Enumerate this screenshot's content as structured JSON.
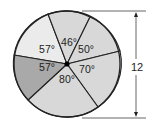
{
  "diagram": {
    "type": "circle-sectors",
    "center": [
      67,
      64
    ],
    "radius": 53,
    "sectors": [
      {
        "label": "57°",
        "angle": 57,
        "fill": "#ebebeb",
        "from": [
          14,
          55
        ],
        "to": [
          48,
          14
        ],
        "label_pos": [
          47,
          53
        ]
      },
      {
        "label": "46°",
        "angle": 46,
        "fill": "#d8d8d8",
        "from": [
          48,
          14
        ],
        "to": [
          90,
          17
        ],
        "label_pos": [
          69,
          46
        ]
      },
      {
        "label": "50°",
        "angle": 50,
        "fill": "#d8d8d8",
        "from": [
          90,
          17
        ],
        "to": [
          120,
          51
        ],
        "label_pos": [
          86,
          53
        ]
      },
      {
        "label": "70°",
        "angle": 70,
        "fill": "#d8d8d8",
        "from": [
          120,
          51
        ],
        "to": [
          98,
          107
        ],
        "label_pos": [
          87,
          73
        ]
      },
      {
        "label": "80°",
        "angle": 80,
        "fill": "#d8d8d8",
        "from": [
          98,
          107
        ],
        "to": [
          28,
          100
        ],
        "label_pos": [
          67,
          83
        ]
      },
      {
        "label": "57°",
        "angle": 57,
        "fill": "#a9a9a9",
        "from": [
          28,
          100
        ],
        "to": [
          14,
          55
        ],
        "label_pos": [
          47,
          71
        ]
      }
    ],
    "dimension": {
      "label": "12",
      "top_y": 11,
      "bottom_y": 118,
      "x": 136,
      "ext_start_x": 82,
      "ext_end_x": 146,
      "label_pos": [
        137,
        71
      ]
    },
    "colors": {
      "stroke": "#222222",
      "dim_line": "#555555"
    }
  }
}
